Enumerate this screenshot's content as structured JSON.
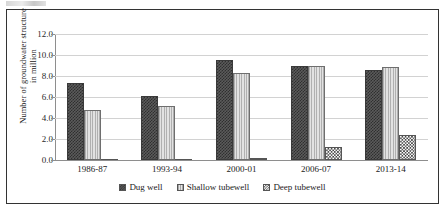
{
  "chart_data": {
    "type": "bar",
    "title": "",
    "xlabel": "",
    "ylabel": "Number of groundwater structure\nin million",
    "categories": [
      "1986-87",
      "1993-94",
      "2000-01",
      "2006-07",
      "2013-14"
    ],
    "series": [
      {
        "name": "Dug well",
        "values": [
          7.3,
          6.1,
          9.55,
          9.0,
          8.6
        ],
        "pattern": "dark-checkerboard",
        "color": "#4a4a4a"
      },
      {
        "name": "Shallow tubewell",
        "values": [
          4.75,
          5.15,
          8.25,
          8.95,
          8.9
        ],
        "pattern": "light-vertical-lines",
        "color": "#d5d5d5"
      },
      {
        "name": "Deep tubewell",
        "values": [
          0.03,
          0.06,
          0.12,
          1.25,
          2.4
        ],
        "pattern": "white-speckle",
        "color": "#ffffff"
      }
    ],
    "ylim": [
      0.0,
      12.0
    ],
    "yticks": [
      "0.0",
      "2.0",
      "4.0",
      "6.0",
      "8.0",
      "10.0",
      "12.0"
    ],
    "ytick_values": [
      0,
      2,
      4,
      6,
      8,
      10,
      12
    ],
    "grid": true,
    "legend_position": "bottom"
  },
  "legend": {
    "items": [
      {
        "label": "Dug well"
      },
      {
        "label": "Shallow tubewell"
      },
      {
        "label": "Deep tubewell"
      }
    ]
  }
}
